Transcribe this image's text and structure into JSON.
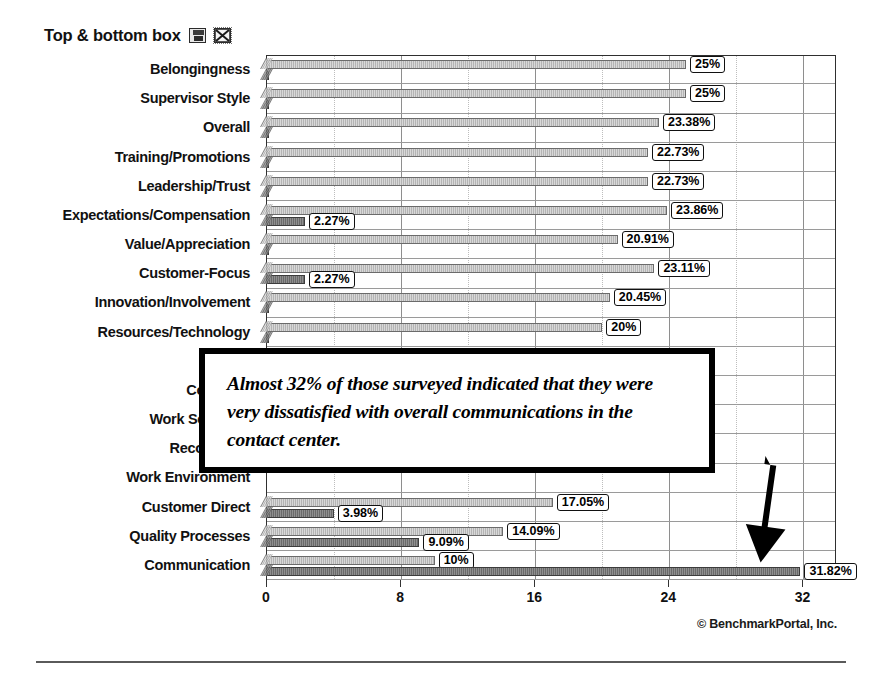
{
  "header": {
    "title": "Top & bottom box",
    "icons": [
      {
        "name": "save-icon",
        "glyph": "save"
      },
      {
        "name": "mail-close-icon",
        "glyph": "mailx"
      }
    ]
  },
  "callout": {
    "text": "Almost 32% of those surveyed indicated that they were very dissatisfied with overall communications in the contact center.",
    "arrow": "down-right-arrow"
  },
  "footer": {
    "copyright": "© BenchmarkPortal, Inc."
  },
  "chart_data": {
    "type": "bar",
    "orientation": "horizontal",
    "title": "Top & bottom box",
    "xlabel": "",
    "ylabel": "",
    "xlim": [
      0,
      34
    ],
    "grid": true,
    "legend": null,
    "xticks": [
      0,
      8,
      16,
      24,
      32
    ],
    "xticklabels": [
      "0",
      "8",
      "16",
      "24",
      "32"
    ],
    "categories": [
      "Belongingness",
      "Supervisor Style",
      "Overall",
      "Training/Promotions",
      "Leadership/Trust",
      "Expectations/Compensation",
      "Value/Appreciation",
      "Customer-Focus",
      "Innovation/Involvement",
      "Resources/Technology",
      "Vision",
      "Coaching",
      "Work Schedule",
      "Recognition",
      "Work Environment",
      "Customer Direct",
      "Quality Processes",
      "Communication"
    ],
    "series": [
      {
        "name": "Top box",
        "values": [
          25,
          25,
          23.38,
          22.73,
          22.73,
          23.86,
          20.91,
          23.11,
          20.45,
          20,
          null,
          null,
          null,
          null,
          null,
          17.05,
          14.09,
          10
        ],
        "labels": [
          "25%",
          "25%",
          "23.38%",
          "22.73%",
          "22.73%",
          "23.86%",
          "20.91%",
          "23.11%",
          "20.45%",
          "20%",
          "",
          "",
          "",
          "",
          "",
          "17.05%",
          "14.09%",
          "10%"
        ]
      },
      {
        "name": "Bottom box",
        "values": [
          0,
          0,
          0,
          0,
          0,
          2.27,
          0,
          2.27,
          0,
          0,
          null,
          null,
          null,
          null,
          null,
          3.98,
          9.09,
          31.82
        ],
        "labels": [
          "",
          "",
          "",
          "",
          "",
          "2.27%",
          "",
          "2.27%",
          "",
          "",
          "",
          "",
          "",
          "",
          "",
          "3.98%",
          "9.09%",
          "31.82%"
        ]
      }
    ]
  }
}
